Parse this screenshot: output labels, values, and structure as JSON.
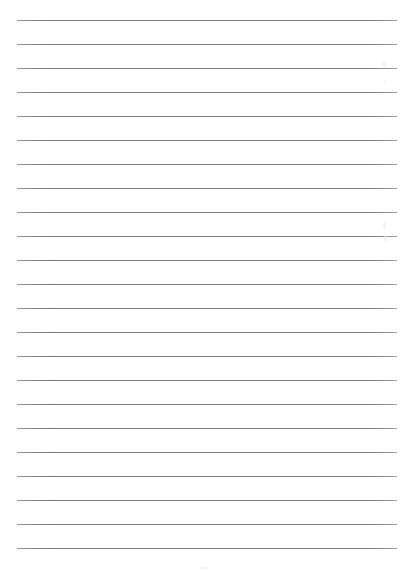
{
  "page": {
    "type": "blank-lined-paper",
    "background_color": "#ffffff",
    "line_color": "#7a7a7a",
    "line_count": 23,
    "line_spacing_px": 24,
    "first_line_y_px": 20,
    "line_left_px": 17,
    "line_right_px": 397,
    "text_lines": [
      "",
      "",
      "",
      "",
      "",
      "",
      "",
      "",
      "",
      "",
      "",
      "",
      "",
      "",
      "",
      "",
      "",
      "",
      "",
      "",
      "",
      "",
      ""
    ]
  }
}
